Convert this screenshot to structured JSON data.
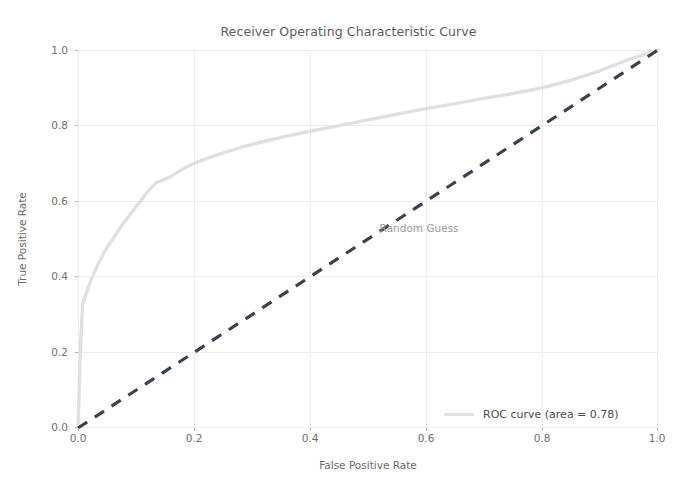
{
  "chart_data": {
    "type": "line",
    "title": "Receiver Operating Characteristic Curve",
    "xlabel": "False Positive Rate",
    "ylabel": "True Positive Rate",
    "xlim": [
      0.0,
      1.0
    ],
    "ylim": [
      0.0,
      1.0
    ],
    "grid": true,
    "legend_position": "lower right",
    "xticks": [
      "0.0",
      "0.2",
      "0.4",
      "0.6",
      "0.8",
      "1.0"
    ],
    "xtick_values": [
      0.0,
      0.2,
      0.4,
      0.6,
      0.8,
      1.0
    ],
    "yticks": [
      "0.0",
      "0.2",
      "0.4",
      "0.6",
      "0.8",
      "1.0"
    ],
    "ytick_values": [
      0.0,
      0.2,
      0.4,
      0.6,
      0.8,
      1.0
    ],
    "auc": 0.78,
    "series": [
      {
        "name": "ROC curve (area = 0.78)",
        "color": "#e0e0e0",
        "linestyle": "solid",
        "linewidth": 3,
        "x": [
          0.0,
          0.004,
          0.008,
          0.014,
          0.022,
          0.032,
          0.045,
          0.06,
          0.08,
          0.1,
          0.12,
          0.135,
          0.145,
          0.16,
          0.18,
          0.2,
          0.22,
          0.25,
          0.28,
          0.32,
          0.36,
          0.4,
          0.45,
          0.5,
          0.55,
          0.6,
          0.65,
          0.7,
          0.75,
          0.8,
          0.85,
          0.9,
          0.95,
          0.98,
          1.0
        ],
        "y": [
          0.0,
          0.2,
          0.33,
          0.355,
          0.39,
          0.425,
          0.465,
          0.5,
          0.545,
          0.585,
          0.625,
          0.65,
          0.655,
          0.665,
          0.685,
          0.7,
          0.712,
          0.728,
          0.742,
          0.758,
          0.772,
          0.785,
          0.8,
          0.815,
          0.83,
          0.845,
          0.858,
          0.872,
          0.885,
          0.9,
          0.92,
          0.945,
          0.975,
          0.99,
          1.0
        ]
      },
      {
        "name": "Random Guess",
        "color": "#3a4250",
        "linestyle": "dashed",
        "linewidth": 3,
        "x": [
          0.0,
          1.0
        ],
        "y": [
          0.0,
          1.0
        ]
      }
    ],
    "annotations": [
      {
        "text": "Random Guess",
        "x": 0.52,
        "y": 0.545,
        "color": "#9a9a9a"
      }
    ]
  },
  "legend": {
    "roc_label": "ROC curve (area = 0.78)"
  }
}
